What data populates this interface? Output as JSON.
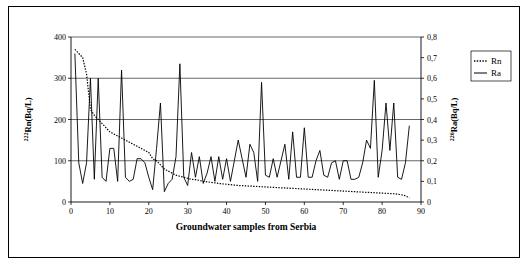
{
  "chart_data": {
    "type": "line",
    "title": "",
    "xlabel": "Groundwater samples from Serbia",
    "ylabel_left": "222Rn(Bq/L)",
    "ylabel_right": "226Ra(Bq/L)",
    "ylabel_left_sup": "222",
    "ylabel_left_base": "Rn(Bq/L)",
    "ylabel_right_sup": "226",
    "ylabel_right_base": "Ra(Bq/L)",
    "xlim": [
      0,
      90
    ],
    "ylim_left": [
      0,
      400
    ],
    "ylim_right": [
      0,
      0.8
    ],
    "xticks": [
      0,
      10,
      20,
      30,
      40,
      50,
      60,
      70,
      80,
      90
    ],
    "yticks_left": [
      0,
      100,
      200,
      300,
      400
    ],
    "yticks_right": [
      0,
      0.1,
      0.2,
      0.3,
      0.4,
      0.5,
      0.6,
      0.7,
      0.8
    ],
    "yticks_right_labels": [
      "0",
      "0,1",
      "0,2",
      "0,3",
      "0,4",
      "0,5",
      "0,6",
      "0,7",
      "0,8"
    ],
    "grid": "horizontal",
    "legend_position": "right",
    "legend": [
      {
        "name": "Rn",
        "style": "dotted",
        "axis": "right"
      },
      {
        "name": "Ra",
        "style": "solid",
        "axis": "left"
      }
    ],
    "series": [
      {
        "name": "Rn",
        "axis": "right",
        "style": "dotted",
        "x": [
          1,
          2,
          3,
          4,
          5,
          6,
          7,
          8,
          9,
          10,
          11,
          12,
          13,
          14,
          15,
          16,
          17,
          18,
          19,
          20,
          21,
          22,
          23,
          24,
          25,
          26,
          27,
          28,
          29,
          30,
          31,
          32,
          33,
          34,
          35,
          36,
          37,
          38,
          39,
          40,
          41,
          42,
          43,
          44,
          45,
          46,
          47,
          48,
          49,
          50,
          51,
          52,
          53,
          54,
          55,
          56,
          57,
          58,
          59,
          60,
          61,
          62,
          63,
          64,
          65,
          66,
          67,
          68,
          69,
          70,
          71,
          72,
          73,
          74,
          75,
          76,
          77,
          78,
          79,
          80,
          81,
          82,
          83,
          84,
          85,
          86,
          87
        ],
        "values": [
          0.74,
          0.72,
          0.7,
          0.62,
          0.45,
          0.42,
          0.4,
          0.38,
          0.36,
          0.34,
          0.33,
          0.32,
          0.31,
          0.3,
          0.29,
          0.28,
          0.27,
          0.26,
          0.25,
          0.24,
          0.21,
          0.2,
          0.18,
          0.16,
          0.15,
          0.14,
          0.13,
          0.125,
          0.12,
          0.115,
          0.11,
          0.108,
          0.105,
          0.1,
          0.098,
          0.095,
          0.093,
          0.09,
          0.088,
          0.086,
          0.084,
          0.082,
          0.08,
          0.079,
          0.078,
          0.077,
          0.076,
          0.075,
          0.074,
          0.073,
          0.072,
          0.071,
          0.07,
          0.069,
          0.068,
          0.067,
          0.066,
          0.065,
          0.064,
          0.063,
          0.062,
          0.061,
          0.06,
          0.059,
          0.058,
          0.057,
          0.056,
          0.055,
          0.054,
          0.053,
          0.052,
          0.051,
          0.05,
          0.049,
          0.048,
          0.047,
          0.046,
          0.045,
          0.044,
          0.043,
          0.042,
          0.041,
          0.04,
          0.038,
          0.035,
          0.03,
          0.02
        ]
      },
      {
        "name": "Ra",
        "axis": "left",
        "style": "solid",
        "x": [
          1,
          2,
          3,
          4,
          5,
          6,
          7,
          8,
          9,
          10,
          11,
          12,
          13,
          14,
          15,
          16,
          17,
          18,
          19,
          20,
          21,
          22,
          23,
          24,
          25,
          26,
          27,
          28,
          29,
          30,
          31,
          32,
          33,
          34,
          35,
          36,
          37,
          38,
          39,
          40,
          41,
          42,
          43,
          44,
          45,
          46,
          47,
          48,
          49,
          50,
          51,
          52,
          53,
          54,
          55,
          56,
          57,
          58,
          59,
          60,
          61,
          62,
          63,
          64,
          65,
          66,
          67,
          68,
          69,
          70,
          71,
          72,
          73,
          74,
          75,
          76,
          77,
          78,
          79,
          80,
          81,
          82,
          83,
          84,
          85,
          86,
          87
        ],
        "values": [
          360,
          95,
          45,
          95,
          300,
          55,
          300,
          60,
          50,
          130,
          130,
          50,
          320,
          60,
          50,
          55,
          105,
          105,
          95,
          60,
          30,
          130,
          240,
          25,
          45,
          55,
          110,
          335,
          60,
          40,
          120,
          60,
          110,
          45,
          70,
          110,
          50,
          110,
          55,
          105,
          50,
          100,
          150,
          105,
          60,
          140,
          120,
          50,
          290,
          65,
          60,
          105,
          60,
          100,
          140,
          55,
          170,
          60,
          60,
          180,
          60,
          60,
          100,
          125,
          65,
          60,
          95,
          100,
          55,
          100,
          100,
          55,
          55,
          60,
          95,
          150,
          130,
          295,
          60,
          125,
          240,
          125,
          240,
          60,
          55,
          95,
          185
        ]
      }
    ]
  }
}
